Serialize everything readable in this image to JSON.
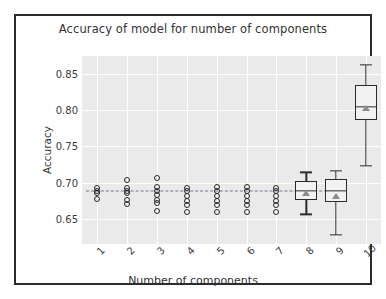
{
  "chart_data": {
    "type": "box",
    "title": "Accuracy of model for number of components",
    "xlabel": "Number of components",
    "ylabel": "Accuracy",
    "categories": [
      "1",
      "2",
      "3",
      "4",
      "5",
      "6",
      "7",
      "8",
      "9",
      "10"
    ],
    "ytick_labels": [
      "0.85",
      "0.80",
      "0.75",
      "0.70",
      "0.65"
    ],
    "ytick_values": [
      0.85,
      0.8,
      0.75,
      0.7,
      0.65
    ],
    "ylim": [
      0.615,
      0.875
    ],
    "grid": true,
    "legend": "none",
    "reference_line": 0.688,
    "colors": {
      "plot_background": "#eaeaea",
      "gridline": "#ffffff",
      "marker_edge": "#262626",
      "box_edge": "#2b2b2b",
      "box_fill": "#f2f2f2",
      "mean_marker": "#8c8c8c",
      "reference_line": "#6d7b8d",
      "frame": "#2b2b2b",
      "text": "#333333"
    },
    "series": [
      {
        "category": "1",
        "render": "points",
        "points": [
          0.693,
          0.688,
          0.686,
          0.677
        ]
      },
      {
        "category": "2",
        "render": "points",
        "points": [
          0.704,
          0.692,
          0.688,
          0.686,
          0.676,
          0.671
        ]
      },
      {
        "category": "3",
        "render": "points",
        "points": [
          0.706,
          0.694,
          0.688,
          0.683,
          0.676,
          0.672,
          0.661
        ]
      },
      {
        "category": "4",
        "render": "points",
        "points": [
          0.693,
          0.688,
          0.681,
          0.675,
          0.669,
          0.66
        ]
      },
      {
        "category": "5",
        "render": "points",
        "points": [
          0.694,
          0.688,
          0.681,
          0.675,
          0.669,
          0.66
        ]
      },
      {
        "category": "6",
        "render": "points",
        "points": [
          0.694,
          0.688,
          0.681,
          0.675,
          0.669,
          0.66
        ]
      },
      {
        "category": "7",
        "render": "points",
        "points": [
          0.693,
          0.688,
          0.681,
          0.675,
          0.669,
          0.66
        ]
      },
      {
        "category": "8",
        "render": "box",
        "whisker_low": 0.656,
        "q1": 0.676,
        "median": 0.688,
        "q3": 0.702,
        "whisker_high": 0.714,
        "mean": 0.685
      },
      {
        "category": "9",
        "render": "box",
        "whisker_low": 0.628,
        "q1": 0.673,
        "median": 0.688,
        "q3": 0.705,
        "whisker_high": 0.716,
        "mean": 0.682
      },
      {
        "category": "10",
        "render": "box",
        "whisker_low": 0.723,
        "q1": 0.787,
        "median": 0.805,
        "q3": 0.835,
        "whisker_high": 0.863,
        "mean": 0.803
      }
    ]
  }
}
